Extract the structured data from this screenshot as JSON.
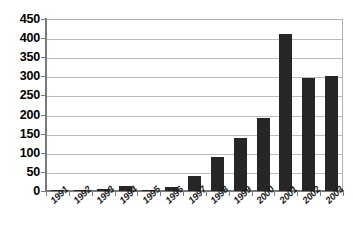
{
  "chart_data": {
    "type": "bar",
    "title": "",
    "xlabel": "",
    "ylabel": "",
    "categories": [
      "1991",
      "1992",
      "1993",
      "1994",
      "1995",
      "1996",
      "1997",
      "1998",
      "1999",
      "2000",
      "2001",
      "2002",
      "2003"
    ],
    "values": [
      3,
      2,
      5,
      14,
      2,
      11,
      40,
      90,
      140,
      190,
      410,
      296,
      302
    ],
    "ylim": [
      0,
      450
    ],
    "ytick_step": 50,
    "yticks": [
      0,
      50,
      100,
      150,
      200,
      250,
      300,
      350,
      400,
      450
    ],
    "ytick_labels": [
      "0",
      "50",
      "100",
      "150",
      "200",
      "250",
      "300",
      "350",
      "400",
      "450"
    ],
    "grid": true,
    "grid_axis": "y",
    "legend": false,
    "legend_position": "none",
    "bar_color": "#262626",
    "gridline_color": "#bdbdbd",
    "axis_color": "#7a7a7a",
    "background_color": "#ffffff",
    "xlabel_rotation": -45,
    "series": [
      {
        "name": "series-1",
        "values": [
          3,
          2,
          5,
          14,
          2,
          11,
          40,
          90,
          140,
          190,
          410,
          296,
          302
        ]
      }
    ]
  }
}
